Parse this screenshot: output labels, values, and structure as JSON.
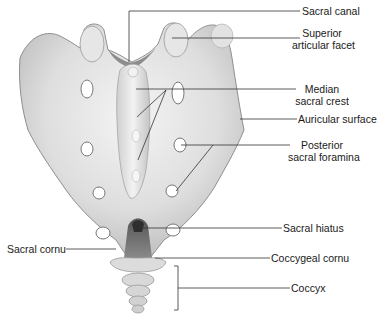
{
  "diagram": {
    "labels": [
      {
        "id": "sacral-canal",
        "lines": [
          "Sacral canal"
        ]
      },
      {
        "id": "superior-articular-facet",
        "lines": [
          "Superior",
          "articular facet"
        ]
      },
      {
        "id": "median-sacral-crest",
        "lines": [
          "Median",
          "sacral crest"
        ]
      },
      {
        "id": "auricular-surface",
        "lines": [
          "Auricular surface"
        ]
      },
      {
        "id": "posterior-sacral-foramina",
        "lines": [
          "Posterior",
          "sacral foramina"
        ]
      },
      {
        "id": "sacral-hiatus",
        "lines": [
          "Sacral hiatus"
        ]
      },
      {
        "id": "sacral-cornu",
        "lines": [
          "Sacral cornu"
        ]
      },
      {
        "id": "coccygeal-cornu",
        "lines": [
          "Coccygeal cornu"
        ]
      },
      {
        "id": "coccyx",
        "lines": [
          "Coccyx"
        ]
      }
    ],
    "colors": {
      "bone_light": "#eeeeee",
      "bone_mid": "#cfcfcf",
      "bone_dark": "#9a9a9a",
      "hole": "#ffffff",
      "leader_line": "#333333"
    }
  }
}
